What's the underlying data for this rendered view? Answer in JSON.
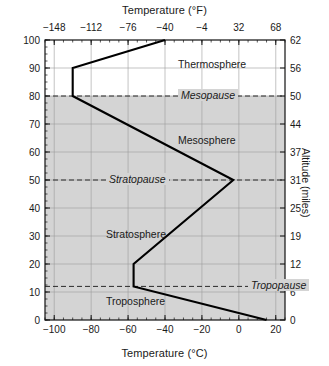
{
  "chart_data": {
    "type": "line",
    "top_axis": {
      "label": "Temperature (°F)",
      "ticks": [
        -148,
        -112,
        -76,
        -40,
        -4,
        32,
        68
      ],
      "tick_labels": [
        "−148",
        "−112",
        "−76",
        "−40",
        "−4",
        "32",
        "68"
      ],
      "range": [
        -157,
        77
      ]
    },
    "bottom_axis": {
      "label": "Temperature (°C)",
      "ticks": [
        -100,
        -80,
        -60,
        -40,
        -20,
        0,
        20
      ],
      "tick_labels": [
        "−100",
        "−80",
        "−60",
        "−40",
        "−20",
        "0",
        "20"
      ],
      "range": [
        -105,
        25
      ],
      "minor_tick_step": 5
    },
    "left_axis": {
      "label": "Altitude (km)",
      "ticks": [
        0,
        10,
        20,
        30,
        40,
        50,
        60,
        70,
        80,
        90,
        100
      ],
      "tick_labels": [
        "0",
        "10",
        "20",
        "30",
        "40",
        "50",
        "60",
        "70",
        "80",
        "90",
        "100"
      ],
      "range": [
        0,
        100
      ],
      "minor_tick_step": 2.5
    },
    "right_axis": {
      "label": "Altitude (miles)",
      "ticks": [
        0,
        10,
        20,
        30,
        40,
        50,
        60,
        70,
        80,
        90,
        100
      ],
      "tick_labels": [
        "0",
        "6",
        "12",
        "19",
        "25",
        "31",
        "37",
        "44",
        "50",
        "56",
        "62"
      ],
      "range": [
        0,
        62
      ]
    },
    "series": [
      {
        "name": "Temperature profile",
        "xlabel": "Temperature (°C)",
        "ylabel": "Altitude (km)",
        "points": [
          {
            "t": 15,
            "alt": 0
          },
          {
            "t": -57,
            "alt": 12
          },
          {
            "t": -57,
            "alt": 20
          },
          {
            "t": -3,
            "alt": 50
          },
          {
            "t": -90,
            "alt": 80
          },
          {
            "t": -90,
            "alt": 90
          },
          {
            "t": -40,
            "alt": 100
          }
        ]
      }
    ],
    "shaded_band": {
      "from_alt": 0,
      "to_alt": 80,
      "color": "#d4d4d4"
    },
    "grid": true,
    "legend": "none",
    "layers": [
      {
        "name": "Troposphere",
        "alt": 6.5,
        "t": -72,
        "style": "upright"
      },
      {
        "name": "Stratosphere",
        "alt": 30.5,
        "t": -72,
        "style": "upright"
      },
      {
        "name": "Mesosphere",
        "alt": 64,
        "t": -33,
        "style": "upright"
      },
      {
        "name": "Thermosphere",
        "alt": 91,
        "t": -33,
        "style": "upright"
      }
    ],
    "boundaries": [
      {
        "name": "Tropopause",
        "alt": 12,
        "label_t": 5,
        "style": "italic-dashed"
      },
      {
        "name": "Stratopause",
        "alt": 50,
        "label_t": -72,
        "style": "italic-dashed"
      },
      {
        "name": "Mesopause",
        "alt": 80,
        "label_t": -33,
        "style": "italic-dashed"
      }
    ]
  }
}
